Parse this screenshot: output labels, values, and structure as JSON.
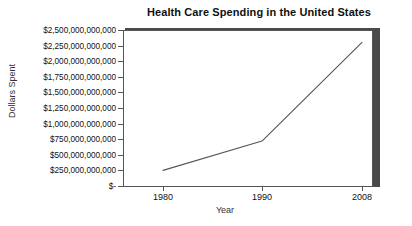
{
  "chart_data": {
    "type": "line",
    "title": "Health Care Spending in the United States",
    "xlabel": "Year",
    "ylabel": "Dollars Spent",
    "categories": [
      "1980",
      "1990",
      "2008"
    ],
    "x": [
      1980,
      1990,
      2008
    ],
    "values": [
      250000000000,
      720000000000,
      2300000000000
    ],
    "series": [
      {
        "name": "Health Care Spending",
        "values": [
          250000000000,
          720000000000,
          2300000000000
        ]
      }
    ],
    "ylim": [
      0,
      2500000000000
    ],
    "ytick_values": [
      0,
      250000000000,
      500000000000,
      750000000000,
      1000000000000,
      1250000000000,
      1500000000000,
      1750000000000,
      2000000000000,
      2250000000000,
      2500000000000
    ],
    "ytick_labels": [
      "$-",
      "$250,000,000,000",
      "$500,000,000,000",
      "$750,000,000,000",
      "$1,000,000,000,000",
      "$1,250,000,000,000",
      "$1,500,000,000,000",
      "$1,750,000,000,000",
      "$2,000,000,000,000",
      "$2,250,000,000,000",
      "$2,500,000,000,000"
    ],
    "xtick_labels": [
      "1980",
      "1990",
      "2008"
    ],
    "grid": false,
    "legend": false,
    "legend_position": "none",
    "colors": {
      "line": "#555555",
      "plot_background": "#ffffff",
      "frame": "#555555",
      "shadow": "#4a4a4a",
      "text": "#111111"
    }
  }
}
